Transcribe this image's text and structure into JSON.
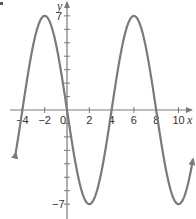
{
  "chart_data": {
    "type": "line",
    "title": "",
    "xlabel": "x",
    "ylabel": "y",
    "function": "y = -7 sin(pi x / 4)",
    "amplitude": 7,
    "period": 8,
    "xlim": [
      -5.2,
      11
    ],
    "ylim": [
      -8,
      7.8
    ],
    "x_ticks": [
      -4,
      -2,
      0,
      2,
      4,
      6,
      8,
      10
    ],
    "x_tick_labels": [
      "−4",
      "−2",
      "0",
      "2",
      "4",
      "6",
      "8",
      "10"
    ],
    "y_ticks": [
      -7,
      -6,
      -5,
      -4,
      -3,
      -2,
      -1,
      1,
      2,
      3,
      4,
      5,
      6,
      7
    ],
    "y_tick_labels": [
      "−7",
      "7"
    ],
    "key_points": [
      {
        "x": -4,
        "y": 0
      },
      {
        "x": -2,
        "y": 7
      },
      {
        "x": 0,
        "y": 0
      },
      {
        "x": 2,
        "y": -7
      },
      {
        "x": 4,
        "y": 0
      },
      {
        "x": 6,
        "y": 7
      },
      {
        "x": 8,
        "y": 0
      },
      {
        "x": 10,
        "y": -7
      }
    ],
    "curve_domain": [
      -4.6,
      11.3
    ],
    "arrows_on_curve_ends": true,
    "grid": false,
    "legend": null,
    "colors": {
      "curve": "#7a7a7a",
      "axes": "#7a7a7a",
      "text": "#333333"
    }
  },
  "labels": {
    "x_axis": "x",
    "y_axis": "y",
    "y_max": "7",
    "y_min": "−7"
  }
}
